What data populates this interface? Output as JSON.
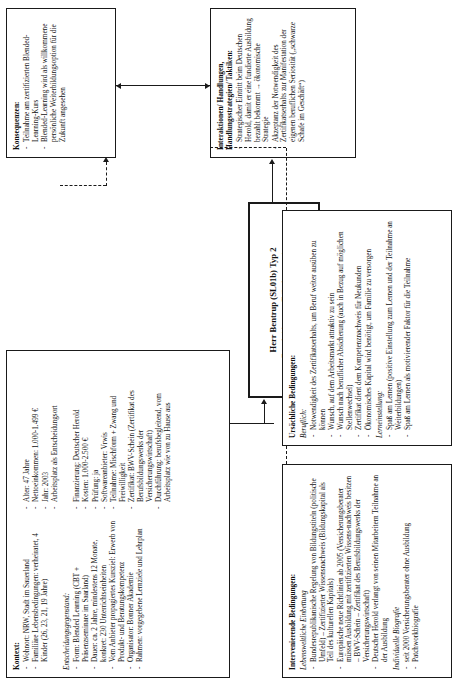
{
  "diagram": {
    "type": "coding-paradigm-model",
    "language": "de"
  },
  "kontext": {
    "header": "Kontext:",
    "items": [
      "Wohnort: NRW, Stadt im Sauerland",
      "Familiäre Lebensbedingungen: verheiratet, 4 Kinder (26, 23, 21, 19 Jahre)",
      "Arbeitsplatz als Entscheidungsort"
    ],
    "person": [
      "Alter: 47 Jahre",
      "Nettoeinkommen: 1.000-1.499 €",
      "Jahr: 2003",
      "Arbeitsplatz als Entscheidungsort"
    ],
    "subhead": "Entscheidungsgegenstand:",
    "gegenstand_left": [
      "Form: Blended Learning (CBT + Präsenzseminare im Saarland)",
      "Dauer: ca. 2 Jahre, mindestens 12 Monate, konkret: 230 Unterrichtseinheiten",
      "Vom Anbieter propagiertes Kursziel: Erwerb von Produkt- und Beratungskompetenz",
      "Organisator: Bonner Akademie",
      "Rahmen: vorgegebene Lernziele und Lehrplan"
    ],
    "gegenstand_right": [
      "Finanzierung: Deutscher Herold",
      "Kosten: 1.000-2.500 €",
      "Prüfung: ja",
      "Softwareanbieter: Vrwis",
      "Teilnahme: Mischform + Zwang und Freiwilligkeit",
      "Zertifikat: BWV-Schein (Zertifikat des Berufsbildungswerks der Versicherungswirtschaft)",
      "Durchführung: berufsbegleitend, vom Arbeitsplatz wie von zu Hause aus"
    ]
  },
  "intervenierende": {
    "header": "Intervenierende Bedingungen:",
    "sub1": "Lebensweltliche Einbettung",
    "items1": [
      "Bundesrepublikanische Regelung von Bildungstiteln (politische Umfeld) – Zertifizierter Wissensnachweis (Bildungskapital als Teil des kulturellen Kapitals)",
      "Europäische neue Richtlinien ab 2005 (Versicherungsberater müssen Ausbildung mit zertifizierten Wissens-nachweis besitzen – BWV-Schein – Zertifikat des Berufsbildungswerks der Versicherungswirtschaft)",
      "Deutscher Herold verlangt von seinen Mitarbeitern Teilnahme an der Ausbildung"
    ],
    "sub2": "Individuelle Biografie",
    "items2": [
      "seit 2000 Versicherungsberater ohne Ausbildung",
      "Patchworkbiografie"
    ]
  },
  "ursaechliche": {
    "header": "Ursächliche Bedingungen:",
    "sub1": "Beruflich:",
    "items1": [
      "Notwendigkeit des Zertifikatserhalts, um Beruf weiter ausüben zu können",
      "Wunsch, auf dem Arbeitsmarkt attraktiv zu sein",
      "Wunsch nach beruflicher Absicherung (auch in Bezug auf möglichen Stellenwechsel)",
      "Zertifikat dient dem Kompetenznachweis für Neukunden",
      "Ökonomisches Kapital wird benötigt, um Familie zu versorgen"
    ],
    "sub2": "Lerneinstellung:",
    "items2": [
      "Spaß am Lernen (positive Einstellung zum Lernen und der Teilnahme an Weiterbildungen)",
      "Spaß am Lernen als motivierender Faktor für die Teilnahme"
    ]
  },
  "center": {
    "title": "Herr Bentrup (SL01b) Typ 2",
    "subtitle": "Entscheidung zur Teilnahme an einer Weiterbildungsmaßnahme (Versicherungsfachmann)"
  },
  "interaktionen": {
    "header": "Interaktionen/ Handlungen, Handlungsstrategien/ Taktiken:",
    "items": [
      "Strategischer Eintritt beim Deutschen Herold, damit er eine fundierte Ausbildung bezahlt bekommt → ökonomische Strategie",
      "Akzeptanz der Notwendigkeit des Zertifikatserhalts zur Manifestation der eigenen beruflichen Seriosität („schwarze Schafe im Geschäft“)"
    ]
  },
  "konsequenzen": {
    "header": "Konsequenzen:",
    "items": [
      "Teilnahme am zertifizierten Blended-Learning-Kurs",
      "Blended-Learning wird als willkommene persönliche Weiterbildungsoption für die Zukunft angesehen"
    ]
  },
  "colors": {
    "line": "#1a1a1a",
    "background": "#ffffff"
  }
}
